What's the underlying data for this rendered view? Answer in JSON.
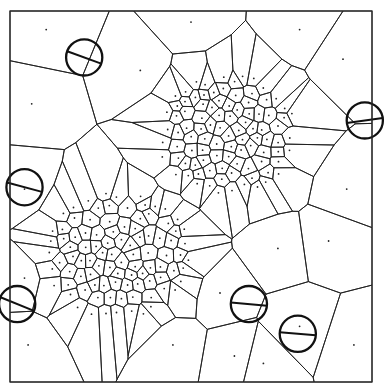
{
  "diagram": {
    "kind": "voronoi-tessellation",
    "domain": [
      0,
      1
    ],
    "ink_color": "#1e1e1e",
    "background": "#ffffff",
    "clusters": [
      {
        "name": "upper-right-cluster",
        "center": [
          0.6,
          0.33
        ],
        "spread": 0.17,
        "count": 95,
        "seed": 7
      },
      {
        "name": "lower-left-cluster",
        "center": [
          0.3,
          0.66
        ],
        "spread": 0.18,
        "count": 95,
        "seed": 13
      }
    ],
    "sparse_sites": [
      [
        0.36,
        0.16
      ],
      [
        0.1,
        0.05
      ],
      [
        0.5,
        0.03
      ],
      [
        0.8,
        0.05
      ],
      [
        0.92,
        0.13
      ],
      [
        0.93,
        0.48
      ],
      [
        0.88,
        0.62
      ],
      [
        0.74,
        0.64
      ],
      [
        0.8,
        0.85
      ],
      [
        0.62,
        0.93
      ],
      [
        0.45,
        0.9
      ],
      [
        0.05,
        0.9
      ],
      [
        0.04,
        0.72
      ],
      [
        0.04,
        0.48
      ],
      [
        0.06,
        0.25
      ],
      [
        0.58,
        0.76
      ],
      [
        0.7,
        0.95
      ],
      [
        0.95,
        0.9
      ]
    ],
    "circles": [
      {
        "name": "circle-top-left",
        "center": [
          0.205,
          0.125
        ],
        "radius": 0.05,
        "chord_angle_deg": 20
      },
      {
        "name": "circle-right",
        "center": [
          0.98,
          0.295
        ],
        "radius": 0.05,
        "chord_angle_deg": -8
      },
      {
        "name": "circle-left",
        "center": [
          0.04,
          0.475
        ],
        "radius": 0.05,
        "chord_angle_deg": 15
      },
      {
        "name": "circle-bottom-left",
        "center": [
          0.02,
          0.79
        ],
        "radius": 0.05,
        "chord_angle_deg": 22
      },
      {
        "name": "circle-bottom-mid",
        "center": [
          0.66,
          0.79
        ],
        "radius": 0.05,
        "chord_angle_deg": 5
      },
      {
        "name": "circle-bottom-right",
        "center": [
          0.795,
          0.87
        ],
        "radius": 0.05,
        "chord_angle_deg": 5
      }
    ]
  }
}
